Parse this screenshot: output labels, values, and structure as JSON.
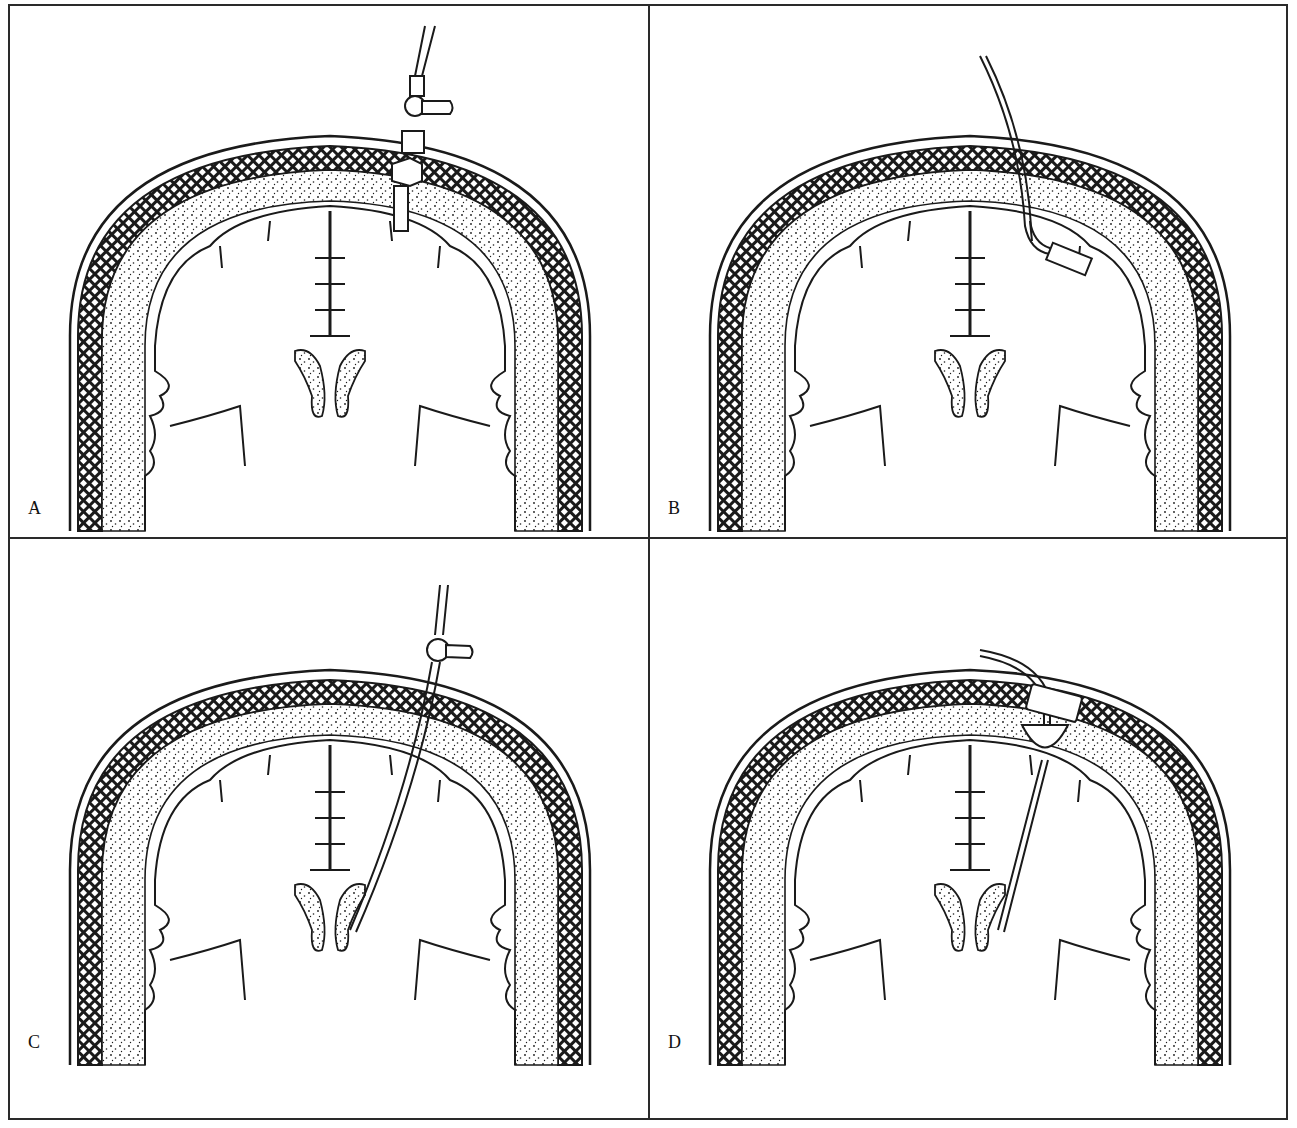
{
  "figure": {
    "colors": {
      "ink": "#1a1a1a",
      "paper": "#ffffff",
      "border": "#2a2a2a"
    },
    "panels": [
      {
        "label": "A",
        "device": "subarachnoid-bolt"
      },
      {
        "label": "B",
        "device": "epidural-sensor"
      },
      {
        "label": "C",
        "device": "intraventricular-catheter"
      },
      {
        "label": "D",
        "device": "intraventricular-catheter-with-reservoir"
      }
    ]
  }
}
